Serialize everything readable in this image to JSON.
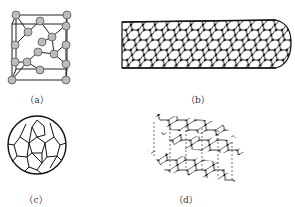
{
  "figure": {
    "panels": [
      {
        "id": "a",
        "label": "（a）",
        "structure": "diamond-cubic-unit-cell"
      },
      {
        "id": "b",
        "label": "（b）",
        "structure": "carbon-nanotube"
      },
      {
        "id": "c",
        "label": "（c）",
        "structure": "fullerene-c60"
      },
      {
        "id": "d",
        "label": "（d）",
        "structure": "graphite-layers"
      }
    ]
  }
}
